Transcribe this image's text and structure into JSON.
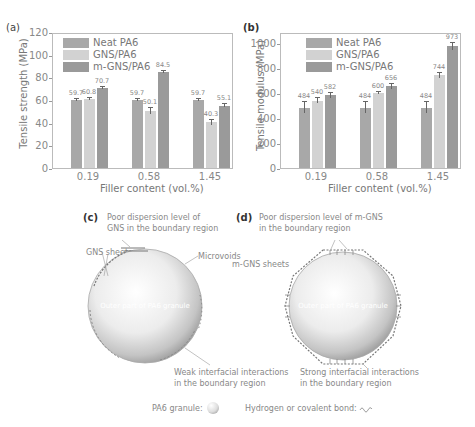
{
  "chart_data": [
    {
      "panel": "(a)",
      "type": "bar",
      "title": "",
      "xlabel": "Filler content (vol.%)",
      "ylabel": "Tensile strength (MPa)",
      "categories": [
        "0.19",
        "0.58",
        "1.45"
      ],
      "ylim": [
        0,
        120
      ],
      "yticks": [
        "0",
        "20",
        "40",
        "60",
        "80",
        "100",
        "120"
      ],
      "legend_position": "upper left",
      "grid": false,
      "series": [
        {
          "name": "Neat PA6",
          "color": "#a8a8a8",
          "values": [
            59.7,
            59.7,
            59.7
          ],
          "labels": [
            "59.7",
            "59.7",
            "59.7"
          ]
        },
        {
          "name": "GNS/PA6",
          "color": "#d2d2d2",
          "values": [
            60.8,
            50.1,
            40.3
          ],
          "labels": [
            "60.8",
            "50.1",
            "40.3"
          ]
        },
        {
          "name": "m-GNS/PA6",
          "color": "#9a9a9a",
          "values": [
            70.7,
            84.5,
            55.1
          ],
          "labels": [
            "70.7",
            "84.5",
            "55.1"
          ]
        }
      ]
    },
    {
      "panel": "(b)",
      "type": "bar",
      "title": "",
      "xlabel": "Filler content (vol.%)",
      "ylabel": "Tensile modulus (MPa)",
      "categories": [
        "0.19",
        "0.58",
        "1.45"
      ],
      "ylim": [
        0,
        1100
      ],
      "yticks": [
        "0",
        "200",
        "400",
        "600",
        "800",
        "1000"
      ],
      "legend_position": "upper left",
      "grid": false,
      "series": [
        {
          "name": "Neat PA6",
          "color": "#a8a8a8",
          "values": [
            484,
            484,
            484
          ],
          "labels": [
            "484",
            "484",
            "484"
          ]
        },
        {
          "name": "GNS/PA6",
          "color": "#d2d2d2",
          "values": [
            540,
            600,
            744
          ],
          "labels": [
            "540",
            "600",
            "744"
          ]
        },
        {
          "name": "m-GNS/PA6",
          "color": "#9a9a9a",
          "values": [
            582,
            656,
            973
          ],
          "labels": [
            "582",
            "656",
            "973"
          ]
        }
      ]
    }
  ],
  "panel_a": {
    "label": "(a)"
  },
  "panel_b": {
    "label": "(b)"
  },
  "panel_c": {
    "label": "(c)",
    "annot_top_1": "Poor dispersion level of",
    "annot_top_2": "GNS in the boundary region",
    "annot_sheets": "GNS sheets",
    "annot_voids": "Microvoids",
    "surface": "Outer part of PA6 granule",
    "annot_bottom_1": "Weak interfacial interactions",
    "annot_bottom_2": "in the boundary region"
  },
  "panel_d": {
    "label": "(d)",
    "annot_top_1": "Poor dispersion level of m-GNS",
    "annot_top_2": "in the boundary region",
    "annot_sheets": "m-GNS sheets",
    "surface": "Outer part of PA6 granule",
    "annot_bottom_1": "Strong interfacial interactions",
    "annot_bottom_2": "in the boundary region"
  },
  "legend_bottom": {
    "granule": "PA6 granule:",
    "bond": "Hydrogen or covalent bond:"
  }
}
